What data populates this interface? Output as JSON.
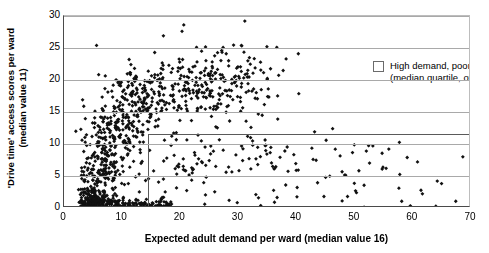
{
  "figure": {
    "axes": {
      "xlabel": "Expected adult demand per ward (median value 16)",
      "ylabel_line1": "'Drive time' access scores per ward",
      "ylabel_line2": "(median value 11)",
      "xticks": [
        "0",
        "10",
        "20",
        "30",
        "40",
        "50",
        "60",
        "70"
      ],
      "yticks": [
        "0",
        "5",
        "10",
        "15",
        "20",
        "25",
        "30"
      ]
    },
    "legend": {
      "swatch_name": "high-demand-poor-access-swatch",
      "line1": "High demand, poor access",
      "line2": "(median quartile, of 1019 wards)"
    },
    "colors": {
      "point": "#111111",
      "grid": "#a9a9a9",
      "axis": "#4a4a4a",
      "box": "#5a5a5a"
    }
  },
  "chart_data": {
    "type": "scatter",
    "title": "",
    "xlabel": "Expected adult demand per ward (median value 16)",
    "ylabel": "'Drive time' access scores per ward (median value 11)",
    "xlim": [
      0,
      70
    ],
    "ylim": [
      0,
      30
    ],
    "xticks": [
      0,
      10,
      20,
      30,
      40,
      50,
      60,
      70
    ],
    "yticks": [
      0,
      5,
      10,
      15,
      20,
      25,
      30
    ],
    "grid": "horizontal",
    "legend_position": "upper-right-inside",
    "n_points_stated": 1019,
    "marker": "diamond",
    "marker_size": 3,
    "highlight_region": {
      "label": "High demand, poor access (median quartile, of 1019 wards)",
      "x_range": [
        14.5,
        70
      ],
      "y_range": [
        0,
        11.5
      ],
      "style": "open rectangle, gray outline"
    },
    "median_x": 16,
    "median_y": 11,
    "series": [
      {
        "name": "wards",
        "description": "Each point is one electoral ward; dense L-shaped cloud concentrated at low demand (2-20) spanning the full access range, with a sparse right tail out to demand 70 at low access.",
        "clusters": [
          {
            "x_center": 5.5,
            "y_center": 1.0,
            "x_spread": 3.0,
            "y_spread": 1.5,
            "n": 210
          },
          {
            "x_center": 7.0,
            "y_center": 6.0,
            "x_spread": 3.5,
            "y_spread": 3.5,
            "n": 150
          },
          {
            "x_center": 9.0,
            "y_center": 12.5,
            "x_spread": 4.0,
            "y_spread": 4.0,
            "n": 160
          },
          {
            "x_center": 13.0,
            "y_center": 17.5,
            "x_spread": 5.0,
            "y_spread": 3.5,
            "n": 150
          },
          {
            "x_center": 22.0,
            "y_center": 19.0,
            "x_spread": 6.0,
            "y_spread": 4.0,
            "n": 130
          },
          {
            "x_center": 30.0,
            "y_center": 19.5,
            "x_spread": 7.0,
            "y_spread": 4.5,
            "n": 110
          },
          {
            "x_center": 20.0,
            "y_center": 7.0,
            "x_spread": 8.0,
            "y_spread": 4.0,
            "n": 60
          },
          {
            "x_center": 32.0,
            "y_center": 8.5,
            "x_spread": 9.0,
            "y_spread": 4.0,
            "n": 34
          },
          {
            "x_center": 48.0,
            "y_center": 7.0,
            "x_spread": 10.0,
            "y_spread": 4.5,
            "n": 15
          }
        ],
        "sample_points": [
          [
            5.6,
            25.4
          ],
          [
            17.1,
            26.9
          ],
          [
            20.6,
            28.6
          ],
          [
            20.3,
            27.6
          ],
          [
            31.1,
            29.2
          ],
          [
            27.9,
            24.1
          ],
          [
            11.2,
            23.2
          ],
          [
            15.6,
            24.3
          ],
          [
            19.9,
            22.8
          ],
          [
            22.8,
            25.1
          ],
          [
            30.5,
            25.4
          ],
          [
            34.9,
            25.2
          ],
          [
            36.6,
            25.1
          ],
          [
            40.3,
            24.1
          ],
          [
            38.2,
            23.3
          ],
          [
            3.2,
            16.9
          ],
          [
            3.4,
            15.9
          ],
          [
            2.9,
            12.3
          ],
          [
            3.1,
            10.6
          ],
          [
            3.0,
            5.1
          ],
          [
            3.6,
            4.4
          ],
          [
            4.1,
            2.8
          ],
          [
            4.6,
            1.6
          ],
          [
            5.2,
            0.7
          ],
          [
            6.1,
            0.4
          ],
          [
            43.1,
            11.9
          ],
          [
            46.2,
            12.4
          ],
          [
            52.0,
            8.9
          ],
          [
            55.4,
            6.2
          ],
          [
            60.8,
            7.2
          ],
          [
            68.6,
            8.0
          ],
          [
            64.2,
            4.2
          ],
          [
            57.6,
            3.1
          ],
          [
            50.3,
            2.4
          ],
          [
            45.0,
            4.8
          ],
          [
            24.2,
            0.6
          ],
          [
            28.4,
            1.2
          ],
          [
            33.0,
            2.1
          ],
          [
            36.2,
            0.9
          ],
          [
            40.1,
            3.2
          ]
        ]
      }
    ]
  }
}
